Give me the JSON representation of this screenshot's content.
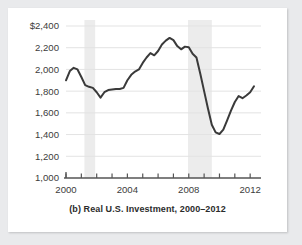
{
  "figure": {
    "caption": "(b) Real U.S. Investment, 2000–12",
    "caption_full": "(b) Real U.S. Investment, 2000–2012",
    "background_color": "#e9eaec",
    "card_color": "#ffffff",
    "line_color": "#3a3a3a",
    "grid_color": "#e3e3e3",
    "band_color": "#ececec",
    "axis_color": "#555555"
  },
  "chart_data": {
    "type": "line",
    "title": "(b) Real U.S. Investment, 2000–2012",
    "xlabel": "",
    "ylabel": "",
    "ylim": [
      1000,
      2400
    ],
    "xlim": [
      2000,
      2012.25
    ],
    "grid": true,
    "legend": false,
    "y_ticks": [
      1000,
      1200,
      1400,
      1600,
      1800,
      2000,
      2200,
      2400
    ],
    "y_tick_labels": [
      "1,000",
      "1,200",
      "1,400",
      "1,600",
      "1,800",
      "2,000",
      "2,200",
      "$2,400"
    ],
    "x_ticks": [
      2000,
      2001,
      2002,
      2003,
      2004,
      2005,
      2006,
      2007,
      2008,
      2009,
      2010,
      2011,
      2012
    ],
    "x_tick_labels_shown": [
      "2000",
      "2004",
      "2008",
      "2012"
    ],
    "x_labeled_ticks": [
      2000,
      2004,
      2008,
      2012
    ],
    "shaded_regions": [
      {
        "label": "2001 recession",
        "start": 2001.2,
        "end": 2001.9
      },
      {
        "label": "2007-2009 recession",
        "start": 2007.95,
        "end": 2009.5
      }
    ],
    "series": [
      {
        "name": "Real U.S. Investment",
        "units": "billions of 2005 dollars",
        "x": [
          2000.0,
          2000.25,
          2000.5,
          2000.75,
          2001.0,
          2001.25,
          2001.5,
          2001.75,
          2002.0,
          2002.25,
          2002.5,
          2002.75,
          2003.0,
          2003.25,
          2003.5,
          2003.75,
          2004.0,
          2004.25,
          2004.5,
          2004.75,
          2005.0,
          2005.25,
          2005.5,
          2005.75,
          2006.0,
          2006.25,
          2006.5,
          2006.75,
          2007.0,
          2007.25,
          2007.5,
          2007.75,
          2008.0,
          2008.25,
          2008.5,
          2008.75,
          2009.0,
          2009.25,
          2009.5,
          2009.75,
          2010.0,
          2010.25,
          2010.5,
          2010.75,
          2011.0,
          2011.25,
          2011.5,
          2011.75,
          2012.0,
          2012.25
        ],
        "y": [
          1900,
          1985,
          2015,
          2000,
          1930,
          1855,
          1840,
          1830,
          1790,
          1740,
          1790,
          1810,
          1815,
          1820,
          1820,
          1830,
          1900,
          1950,
          1980,
          2000,
          2060,
          2110,
          2150,
          2130,
          2170,
          2230,
          2265,
          2290,
          2270,
          2215,
          2185,
          2210,
          2205,
          2145,
          2110,
          1960,
          1800,
          1640,
          1490,
          1420,
          1405,
          1445,
          1530,
          1620,
          1700,
          1755,
          1735,
          1760,
          1790,
          1845
        ]
      }
    ]
  }
}
